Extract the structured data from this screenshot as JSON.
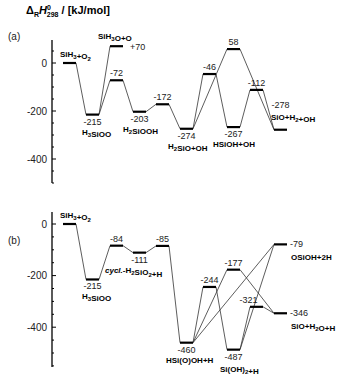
{
  "chart_data": [
    {
      "type": "energy-level-diagram",
      "panel": "(a)",
      "ylabel": "ΔRH°298 / [kJ/mol]",
      "yticks": [
        0,
        -200,
        -400
      ],
      "ylim": [
        -500,
        90
      ],
      "levels": [
        {
          "id": "a0",
          "value": 0,
          "label": "",
          "species": "SiH3+O2",
          "col": 0
        },
        {
          "id": "a1",
          "value": -215,
          "label": "-215",
          "species": "H3SiOO",
          "col": 1
        },
        {
          "id": "a2",
          "value": 70,
          "label": "+70",
          "species": "SiH3O+O",
          "col": 2
        },
        {
          "id": "a3",
          "value": -72,
          "label": "-72",
          "species": "",
          "col": 2
        },
        {
          "id": "a4",
          "value": -203,
          "label": "-203",
          "species": "H2SiOOH",
          "col": 3
        },
        {
          "id": "a5",
          "value": -172,
          "label": "-172",
          "species": "",
          "col": 4
        },
        {
          "id": "a6",
          "value": -274,
          "label": "-274",
          "species": "H2SiO+OH",
          "col": 5
        },
        {
          "id": "a7",
          "value": -46,
          "label": "-46",
          "species": "",
          "col": 6
        },
        {
          "id": "a8",
          "value": 58,
          "label": "58",
          "species": "",
          "col": 7
        },
        {
          "id": "a9",
          "value": -267,
          "label": "-267",
          "species": "HSiOH+OH",
          "col": 7
        },
        {
          "id": "a10",
          "value": -112,
          "label": "-112",
          "species": "",
          "col": 8
        },
        {
          "id": "a11",
          "value": -278,
          "label": "-278",
          "species": "SiO+H2+OH",
          "col": 9
        }
      ],
      "connections": [
        [
          "a0",
          "a1"
        ],
        [
          "a1",
          "a2"
        ],
        [
          "a1",
          "a3"
        ],
        [
          "a3",
          "a4"
        ],
        [
          "a4",
          "a5"
        ],
        [
          "a5",
          "a6"
        ],
        [
          "a6",
          "a7"
        ],
        [
          "a6",
          "a8"
        ],
        [
          "a7",
          "a9"
        ],
        [
          "a8",
          "a11"
        ],
        [
          "a9",
          "a10"
        ],
        [
          "a10",
          "a11"
        ]
      ]
    },
    {
      "type": "energy-level-diagram",
      "panel": "(b)",
      "ylabel": "ΔRH°298 / [kJ/mol]",
      "yticks": [
        0,
        -200,
        -400
      ],
      "ylim": [
        -560,
        40
      ],
      "levels": [
        {
          "id": "b0",
          "value": 0,
          "label": "",
          "species": "SiH3+O2",
          "col": 0
        },
        {
          "id": "b1",
          "value": -215,
          "label": "-215",
          "species": "H3SiOO",
          "col": 1
        },
        {
          "id": "b2",
          "value": -84,
          "label": "-84",
          "species": "",
          "col": 2
        },
        {
          "id": "b3",
          "value": -111,
          "label": "-111",
          "species": "cycl.-H2SiO2+H",
          "col": 3
        },
        {
          "id": "b4",
          "value": -85,
          "label": "-85",
          "species": "",
          "col": 4
        },
        {
          "id": "b5",
          "value": -460,
          "label": "-460",
          "species": "HSi(O)OH+H",
          "col": 5
        },
        {
          "id": "b6",
          "value": -244,
          "label": "-244",
          "species": "",
          "col": 6
        },
        {
          "id": "b7",
          "value": -177,
          "label": "-177",
          "species": "",
          "col": 7
        },
        {
          "id": "b8",
          "value": -487,
          "label": "-487",
          "species": "Si(OH)2+H",
          "col": 7
        },
        {
          "id": "b9",
          "value": -321,
          "label": "-321",
          "species": "",
          "col": 8
        },
        {
          "id": "b10",
          "value": -79,
          "label": "-79",
          "species": "OSiOH+2H",
          "col": 9
        },
        {
          "id": "b11",
          "value": -346,
          "label": "-346",
          "species": "SiO+H2O+H",
          "col": 9
        }
      ],
      "connections": [
        [
          "b0",
          "b1"
        ],
        [
          "b1",
          "b2"
        ],
        [
          "b2",
          "b3"
        ],
        [
          "b3",
          "b4"
        ],
        [
          "b4",
          "b5"
        ],
        [
          "b5",
          "b6"
        ],
        [
          "b5",
          "b7"
        ],
        [
          "b5",
          "b10"
        ],
        [
          "b6",
          "b8"
        ],
        [
          "b7",
          "b11"
        ],
        [
          "b8",
          "b9"
        ],
        [
          "b8",
          "b10"
        ],
        [
          "b9",
          "b11"
        ]
      ]
    }
  ],
  "labels": {
    "ylabel_main": "Δ",
    "ylabel_sub": "R",
    "ylabel_H": "H",
    "ylabel_sup": "0",
    "ylabel_sub2": "298",
    "ylabel_unit": " / [kJ/mol]",
    "panel_a": "(a)",
    "panel_b": "(b)",
    "tick_0": "0",
    "tick_m200": "-200",
    "tick_m400": "-400"
  }
}
